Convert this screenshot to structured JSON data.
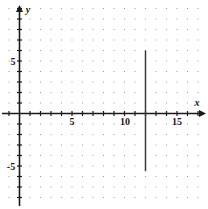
{
  "chart_data": {
    "type": "line",
    "title": "",
    "xlabel": "x",
    "ylabel": "y",
    "xlim": [
      -1.8,
      18.0
    ],
    "ylim": [
      -9.0,
      10.2
    ],
    "grid": true,
    "grid_style": "dots",
    "grid_spacing": 1,
    "legend": "none",
    "x_ticks": [
      5,
      10,
      15
    ],
    "x_tick_labels": [
      "5",
      "10",
      "15"
    ],
    "y_ticks": [
      5,
      -5
    ],
    "y_tick_labels": [
      "5",
      "-5"
    ],
    "x_tick_minor_step": 1,
    "y_tick_minor_step": 1,
    "series": [
      {
        "name": "vertical-line",
        "type": "vertical-segment",
        "x": 12,
        "y_start": -5.5,
        "y_end": 6.0,
        "color": "#3a3a3a"
      }
    ],
    "annotations": []
  },
  "axes": {
    "x_axis_label": "x",
    "y_axis_label": "y",
    "origin_label": "",
    "x_axis_color": "#1a1a1a",
    "y_axis_color": "#1a1a1a"
  },
  "labels": {
    "x5": "5",
    "x10": "10",
    "x15": "15",
    "y5": "5",
    "yneg5": "-5"
  },
  "colors": {
    "background": "#ffffff",
    "axis": "#1a1a1a",
    "grid_dot": "#9a9a9a",
    "data": "#3a3a3a"
  }
}
